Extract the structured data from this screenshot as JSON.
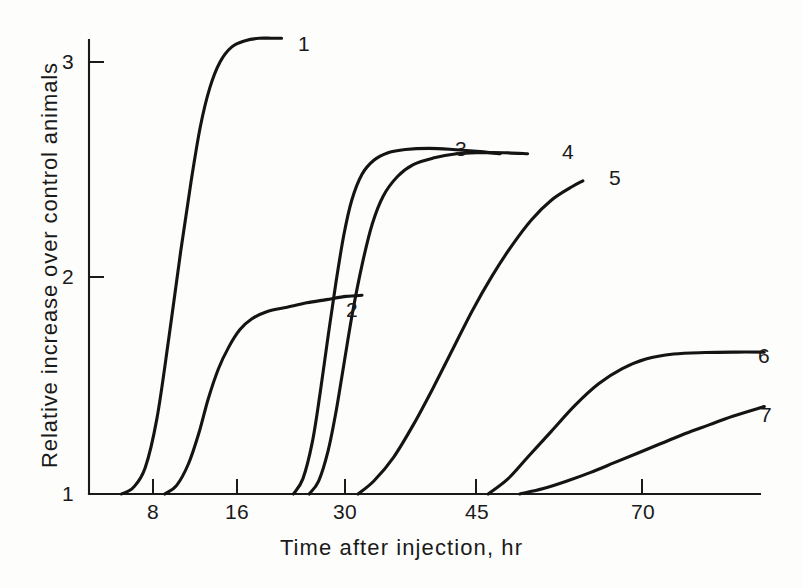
{
  "chart_data": {
    "type": "line",
    "title": "",
    "xlabel": "Time after injection, hr",
    "ylabel": "Relative increase over control animals",
    "xlim": [
      0,
      88
    ],
    "ylim": [
      1,
      3.25
    ],
    "grid": false,
    "legend": "inline-end-of-curve-labels",
    "xticks": [
      8,
      16,
      30,
      45,
      70
    ],
    "xtick_labels": [
      "8",
      "16",
      "30",
      "45",
      "70"
    ],
    "yticks": [
      1,
      2,
      3
    ],
    "ytick_labels": [
      "1",
      "2",
      "3"
    ],
    "series": [
      {
        "name": "1",
        "label": "1",
        "x": [
          4.0,
          5.5,
          7.0,
          8.5,
          10.0,
          11.5,
          12.8,
          14.0,
          15.2,
          16.5,
          18.0,
          19.8,
          21.5,
          23.0,
          24.3
        ],
        "y": [
          1.0,
          1.03,
          1.12,
          1.35,
          1.72,
          2.12,
          2.44,
          2.7,
          2.88,
          3.0,
          3.07,
          3.1,
          3.11,
          3.11,
          3.11
        ]
      },
      {
        "name": "2",
        "label": "2",
        "x": [
          9.5,
          11.0,
          12.5,
          13.8,
          15.0,
          16.3,
          17.6,
          19.0,
          20.5,
          22.5,
          25.0,
          27.5,
          30.0,
          32.5,
          34.5
        ],
        "y": [
          1.0,
          1.04,
          1.14,
          1.28,
          1.44,
          1.58,
          1.68,
          1.76,
          1.81,
          1.845,
          1.865,
          1.885,
          1.9,
          1.915,
          1.92
        ]
      },
      {
        "name": "3",
        "label": "3",
        "x": [
          25.8,
          27.0,
          28.2,
          29.2,
          30.2,
          31.2,
          32.2,
          33.2,
          34.5,
          36.0,
          37.8,
          40.0,
          43.0,
          46.0,
          49.5,
          52.0
        ],
        "y": [
          1.0,
          1.07,
          1.24,
          1.47,
          1.73,
          1.98,
          2.2,
          2.36,
          2.48,
          2.545,
          2.58,
          2.595,
          2.6,
          2.595,
          2.585,
          2.575
        ]
      },
      {
        "name": "4",
        "label": "4",
        "x": [
          27.8,
          29.0,
          30.2,
          31.2,
          32.2,
          33.3,
          34.5,
          35.8,
          37.2,
          39.0,
          41.0,
          43.5,
          46.5,
          49.5,
          52.5,
          55.5
        ],
        "y": [
          1.0,
          1.06,
          1.2,
          1.38,
          1.6,
          1.84,
          2.06,
          2.25,
          2.38,
          2.47,
          2.525,
          2.555,
          2.575,
          2.58,
          2.58,
          2.575
        ]
      },
      {
        "name": "5",
        "label": "5",
        "x": [
          34.0,
          36.0,
          38.5,
          41.0,
          43.5,
          46.0,
          48.5,
          51.0,
          53.5,
          56.0,
          58.5,
          61.0,
          62.5
        ],
        "y": [
          1.0,
          1.06,
          1.17,
          1.32,
          1.49,
          1.67,
          1.85,
          2.01,
          2.15,
          2.27,
          2.36,
          2.42,
          2.45
        ]
      },
      {
        "name": "6",
        "label": "6",
        "x": [
          50.5,
          53.0,
          55.5,
          58.5,
          61.5,
          64.5,
          67.5,
          70.5,
          74.0,
          78.0,
          82.0,
          85.5
        ],
        "y": [
          1.0,
          1.07,
          1.17,
          1.29,
          1.41,
          1.51,
          1.58,
          1.625,
          1.648,
          1.655,
          1.657,
          1.657
        ]
      },
      {
        "name": "7",
        "label": "7",
        "x": [
          54.5,
          57.5,
          60.5,
          63.5,
          66.5,
          69.5,
          72.5,
          75.5,
          78.5,
          81.5,
          85.5
        ],
        "y": [
          1.0,
          1.025,
          1.06,
          1.1,
          1.145,
          1.19,
          1.235,
          1.28,
          1.32,
          1.36,
          1.405
        ]
      }
    ]
  },
  "axes": {
    "y_title": "Relative increase over control animals",
    "x_title": "Time after injection, hr",
    "x_tick_labels": [
      "8",
      "16",
      "30",
      "45",
      "70"
    ],
    "y_tick_labels": [
      "3",
      "2",
      "1"
    ]
  },
  "curve_labels": {
    "c1": "1",
    "c2": "2",
    "c3": "3",
    "c4": "4",
    "c5": "5",
    "c6": "6",
    "c7": "7"
  },
  "style": {
    "line_color": "#141414",
    "axis_color": "#1a1a1a",
    "background": "#fdfdfc"
  }
}
